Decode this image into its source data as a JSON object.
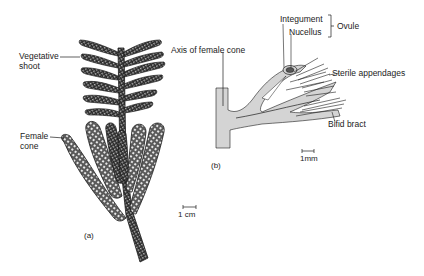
{
  "panel_a": {
    "caption": "(a)",
    "labels": {
      "vegetative_shoot_line1": "Vegetative",
      "vegetative_shoot_line2": "shoot",
      "female_cone_line1": "Female",
      "female_cone_line2": "cone"
    },
    "scale_bar": "1 cm"
  },
  "panel_b": {
    "caption": "(b)",
    "labels": {
      "axis": "Axis of female cone",
      "integument": "Integument",
      "nucellus": "Nucellus",
      "ovule": "Ovule",
      "sterile_appendages": "Sterile appendages",
      "bifid_bract": "Bifid bract"
    },
    "scale_bar": "1mm"
  },
  "colors": {
    "ink": "#1c1c1c",
    "axis_fill": "#d4d4d4",
    "background": "#ffffff"
  }
}
